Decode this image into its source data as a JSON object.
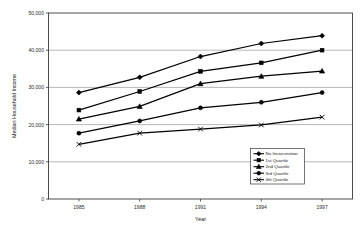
{
  "chart_data": {
    "type": "line",
    "title": "",
    "xlabel": "Year",
    "ylabel": "Median Household Income",
    "categories": [
      "1985",
      "1988",
      "1991",
      "1994",
      "1997"
    ],
    "x": [
      1985,
      1988,
      1991,
      1994,
      1997
    ],
    "ylim": [
      0,
      50000
    ],
    "xlim": [
      0,
      4
    ],
    "grid": true,
    "grid_axis": "y",
    "legend_position": "inside-bottom-right",
    "y_ticks": [
      0,
      10000,
      20000,
      30000,
      40000,
      50000
    ],
    "y_tick_labels": [
      "0",
      "10,000",
      "20,000",
      "30,000",
      "40,000",
      "50,000"
    ],
    "x_tick_labels": [
      "1985",
      "1988",
      "1991",
      "1994",
      "1997"
    ],
    "series": [
      {
        "name": "No Incarceration",
        "marker": "diamond",
        "values": [
          28600,
          32700,
          38300,
          41800,
          43900
        ]
      },
      {
        "name": "1st Quartile",
        "marker": "square",
        "values": [
          23900,
          28900,
          34300,
          36600,
          40000
        ]
      },
      {
        "name": "2nd Quartile",
        "marker": "triangle",
        "values": [
          21500,
          24900,
          31000,
          33000,
          34400
        ]
      },
      {
        "name": "3rd Quartile",
        "marker": "circle",
        "values": [
          17700,
          21000,
          24500,
          26000,
          28600
        ]
      },
      {
        "name": "4th Quartile",
        "marker": "x",
        "values": [
          14700,
          17700,
          18800,
          19900,
          22000
        ]
      }
    ]
  },
  "legend": {
    "entries": [
      {
        "label": "No Incarceration"
      },
      {
        "label": "1st Quartile"
      },
      {
        "label": "2nd Quartile"
      },
      {
        "label": "3rd Quartile"
      },
      {
        "label": "4th Quartile"
      }
    ]
  },
  "colors": {
    "series": "#000000",
    "grid": "#9a9a9a",
    "axis": "#3a3a3a",
    "background": "#ffffff"
  }
}
